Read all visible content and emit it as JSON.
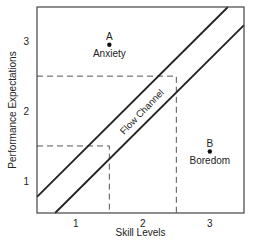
{
  "chart_data": {
    "type": "diagram",
    "title": "",
    "xlabel": "Skill Levels",
    "ylabel": "Performance Expectations",
    "xlim": [
      0.42,
      3.51
    ],
    "ylim": [
      0.54,
      3.49
    ],
    "x_ticks": [
      {
        "value": 1,
        "label": "1"
      },
      {
        "value": 2,
        "label": "2"
      },
      {
        "value": 3,
        "label": "3"
      }
    ],
    "y_ticks": [
      {
        "value": 1,
        "label": "1"
      },
      {
        "value": 2,
        "label": "2"
      },
      {
        "value": 3,
        "label": "3"
      }
    ],
    "channel_lines": [
      {
        "name": "upper-boundary",
        "from": [
          0.42,
          0.77
        ],
        "to": [
          3.27,
          3.49
        ]
      },
      {
        "name": "lower-boundary",
        "from": [
          0.69,
          0.54
        ],
        "to": [
          3.51,
          3.23
        ]
      }
    ],
    "channel_label": "Flow Channel",
    "dashed_guides": [
      {
        "name": "guide-1-5",
        "x": 1.5,
        "y": 1.5
      },
      {
        "name": "guide-2-5",
        "x": 2.5,
        "y": 2.5
      }
    ],
    "points": [
      {
        "id": "A",
        "label": "A",
        "caption": "Anxiety",
        "x": 1.5,
        "y": 2.95
      },
      {
        "id": "B",
        "label": "B",
        "caption": "Boredom",
        "x": 3.0,
        "y": 1.42
      }
    ]
  }
}
